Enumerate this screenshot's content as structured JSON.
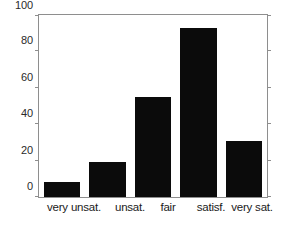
{
  "chart_data": {
    "type": "bar",
    "title": "",
    "subtitle": "",
    "xlabel": "",
    "ylabel": "",
    "categories": [
      "very unsat.",
      "unsat.",
      "fair",
      "satisf.",
      "very sat."
    ],
    "values": [
      8,
      19,
      55,
      93,
      31
    ],
    "series": [
      {
        "name": "responses",
        "values": [
          8,
          19,
          55,
          93,
          31
        ]
      }
    ],
    "ylim": [
      0,
      100
    ],
    "yticks": [
      0,
      20,
      40,
      60,
      80,
      100
    ],
    "ytick_labels": [
      "0",
      "20",
      "40",
      "60",
      "80",
      "100"
    ],
    "xlim": [
      0.5,
      5.5
    ],
    "grid": false,
    "legend": null,
    "legend_position": "none",
    "bar_color": "#0b0b0b",
    "axis_color": "#8e8e8e",
    "background_color": "#ffffff",
    "annotations": []
  }
}
